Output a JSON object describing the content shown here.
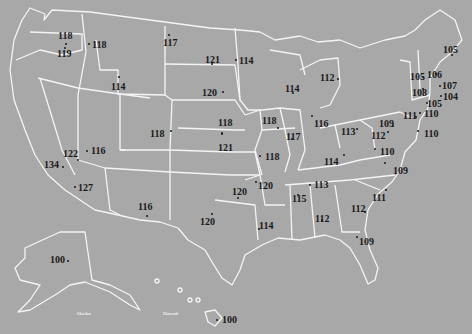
{
  "map": {
    "background_color": "#a8a8a8",
    "border_color": "#f4f4f4",
    "label_color": "#1a1a1a",
    "inset_labels": [
      "Alaska",
      "Hawaii"
    ],
    "points": [
      {
        "region": "Washington",
        "value": "118"
      },
      {
        "region": "Oregon",
        "value": "119"
      },
      {
        "region": "Idaho",
        "value": "118"
      },
      {
        "region": "Montana",
        "value": "117"
      },
      {
        "region": "Wyoming",
        "value": "114"
      },
      {
        "region": "North Dakota",
        "value": "121"
      },
      {
        "region": "Minnesota",
        "value": "114"
      },
      {
        "region": "South Dakota",
        "value": "120"
      },
      {
        "region": "Wisconsin",
        "value": "114"
      },
      {
        "region": "Michigan",
        "value": "112"
      },
      {
        "region": "Maine",
        "value": "105"
      },
      {
        "region": "Vermont",
        "value": "105"
      },
      {
        "region": "New Hampshire",
        "value": "106"
      },
      {
        "region": "Massachusetts",
        "value": "107"
      },
      {
        "region": "New York",
        "value": "108"
      },
      {
        "region": "Rhode Island",
        "value": "104"
      },
      {
        "region": "Connecticut",
        "value": "105"
      },
      {
        "region": "New Jersey",
        "value": "110"
      },
      {
        "region": "Pennsylvania",
        "value": "111"
      },
      {
        "region": "Delaware",
        "value": "110"
      },
      {
        "region": "Maryland",
        "value": "109"
      },
      {
        "region": "West Virginia",
        "value": "112"
      },
      {
        "region": "Virginia",
        "value": "110"
      },
      {
        "region": "North Carolina",
        "value": "109"
      },
      {
        "region": "Ohio",
        "value": "113"
      },
      {
        "region": "Indiana",
        "value": "116"
      },
      {
        "region": "Illinois",
        "value": "117"
      },
      {
        "region": "Iowa",
        "value": "118"
      },
      {
        "region": "Nebraska",
        "value": "118"
      },
      {
        "region": "Kansas",
        "value": "121"
      },
      {
        "region": "Missouri",
        "value": "118"
      },
      {
        "region": "Kentucky",
        "value": "114"
      },
      {
        "region": "Tennessee",
        "value": "113"
      },
      {
        "region": "Colorado",
        "value": "118"
      },
      {
        "region": "Nevada",
        "value": "122"
      },
      {
        "region": "Utah",
        "value": "116"
      },
      {
        "region": "California",
        "value": "134"
      },
      {
        "region": "Arizona",
        "value": "127"
      },
      {
        "region": "New Mexico",
        "value": "116"
      },
      {
        "region": "Oklahoma",
        "value": "120"
      },
      {
        "region": "Arkansas",
        "value": "120"
      },
      {
        "region": "Texas",
        "value": "120"
      },
      {
        "region": "Louisiana",
        "value": "114"
      },
      {
        "region": "Mississippi",
        "value": "115"
      },
      {
        "region": "Alabama",
        "value": "112"
      },
      {
        "region": "Georgia",
        "value": "112"
      },
      {
        "region": "South Carolina",
        "value": "111"
      },
      {
        "region": "Florida",
        "value": "109"
      },
      {
        "region": "Alaska",
        "value": "100"
      },
      {
        "region": "Hawaii",
        "value": "100"
      }
    ]
  }
}
